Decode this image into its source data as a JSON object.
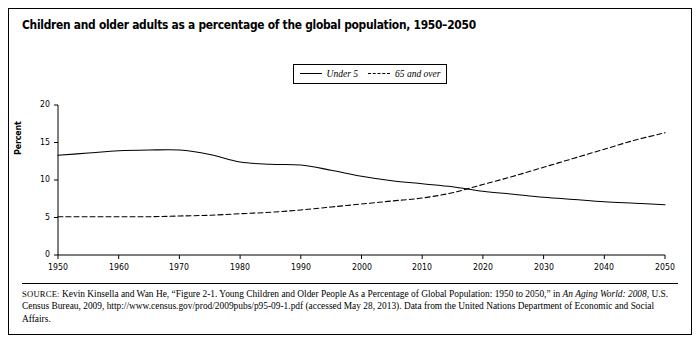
{
  "figure": {
    "title": "Children and older adults as a percentage of the global population, 1950–2050",
    "source_prefix": "SOURCE:",
    "source_text_1": " Kevin Kinsella and Wan He, “Figure 2-1. Young Children and Older People As a Percentage of Global Population: 1950 to 2050,” in ",
    "source_italic_1": "An Aging World: 2008",
    "source_text_2": ", U.S. Census Bureau, 2009, http://www.census.gov/prod/2009pubs/p95-09-1.pdf (accessed May 28, 2013). Data from the United Nations Department of Economic and Social Affairs."
  },
  "chart_data": {
    "type": "line",
    "title": "Children and older adults as a percentage of the global population, 1950–2050",
    "xlabel": "",
    "ylabel": "Percent",
    "xlim": [
      1950,
      2050
    ],
    "ylim": [
      0,
      20
    ],
    "grid": false,
    "legend_position": "top-center",
    "xticks": [
      1950,
      1960,
      1970,
      1980,
      1990,
      2000,
      2010,
      2020,
      2030,
      2040,
      2050
    ],
    "xtick_labels": [
      "1950",
      "1960",
      "1970",
      "1980",
      "1990",
      "2000",
      "2010",
      "2020",
      "2030",
      "2040",
      "2050"
    ],
    "yticks": [
      0,
      5,
      10,
      15,
      20
    ],
    "ytick_labels": [
      "0",
      "5",
      "10",
      "15",
      "20"
    ],
    "x": [
      1950,
      1955,
      1960,
      1965,
      1970,
      1975,
      1980,
      1985,
      1990,
      1995,
      2000,
      2005,
      2010,
      2015,
      2020,
      2025,
      2030,
      2035,
      2040,
      2045,
      2050
    ],
    "series": [
      {
        "name": "Under 5",
        "style": "solid",
        "color": "#000000",
        "values": [
          13.3,
          13.6,
          13.9,
          14.0,
          14.0,
          13.4,
          12.4,
          12.1,
          12.0,
          11.3,
          10.5,
          9.9,
          9.5,
          9.1,
          8.5,
          8.1,
          7.7,
          7.4,
          7.1,
          6.9,
          6.7
        ]
      },
      {
        "name": "65 and over",
        "style": "dashed",
        "color": "#000000",
        "values": [
          5.1,
          5.1,
          5.1,
          5.1,
          5.2,
          5.3,
          5.5,
          5.7,
          6.0,
          6.4,
          6.8,
          7.2,
          7.6,
          8.3,
          9.4,
          10.5,
          11.7,
          12.9,
          14.1,
          15.3,
          16.3
        ]
      }
    ],
    "annotations": [
      {
        "note": "Curves cross at approximately 2016 at about 8.8 percent"
      }
    ]
  }
}
